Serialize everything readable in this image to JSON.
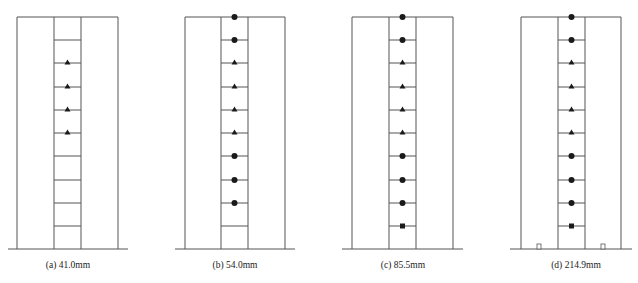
{
  "colors": {
    "line": "#555555",
    "marker": "#1a1a1a",
    "background": "#ffffff"
  },
  "layout": {
    "top_y": 17,
    "ground_y": 249,
    "rung_y": [
      40,
      63,
      87,
      110,
      133,
      156,
      180,
      203,
      226
    ]
  },
  "panels": [
    {
      "id": "a",
      "caption": "(a) 41.0mm",
      "outer": [
        17,
        118
      ],
      "inner": [
        54,
        81
      ],
      "ground": [
        8,
        128
      ],
      "markers": [
        {
          "level": 2,
          "shape": "triangle"
        },
        {
          "level": 3,
          "shape": "triangle"
        },
        {
          "level": 4,
          "shape": "triangle"
        },
        {
          "level": 5,
          "shape": "triangle"
        }
      ],
      "base_squares": []
    },
    {
      "id": "b",
      "caption": "(b) 54.0mm",
      "outer": [
        185,
        285
      ],
      "inner": [
        221,
        248
      ],
      "ground": [
        175,
        295
      ],
      "markers": [
        {
          "level": 0,
          "shape": "circle"
        },
        {
          "level": 1,
          "shape": "circle"
        },
        {
          "level": 2,
          "shape": "triangle"
        },
        {
          "level": 3,
          "shape": "triangle"
        },
        {
          "level": 4,
          "shape": "triangle"
        },
        {
          "level": 5,
          "shape": "triangle"
        },
        {
          "level": 6,
          "shape": "circle"
        },
        {
          "level": 7,
          "shape": "circle"
        },
        {
          "level": 8,
          "shape": "circle"
        }
      ],
      "base_squares": []
    },
    {
      "id": "c",
      "caption": "(c) 85.5mm",
      "outer": [
        352,
        453
      ],
      "inner": [
        389,
        416
      ],
      "ground": [
        342,
        463
      ],
      "markers": [
        {
          "level": 0,
          "shape": "circle"
        },
        {
          "level": 1,
          "shape": "circle"
        },
        {
          "level": 2,
          "shape": "triangle"
        },
        {
          "level": 3,
          "shape": "triangle"
        },
        {
          "level": 4,
          "shape": "triangle"
        },
        {
          "level": 5,
          "shape": "triangle"
        },
        {
          "level": 6,
          "shape": "circle"
        },
        {
          "level": 7,
          "shape": "circle"
        },
        {
          "level": 8,
          "shape": "circle"
        },
        {
          "level": 9,
          "shape": "square"
        }
      ],
      "base_squares": []
    },
    {
      "id": "d",
      "caption": "(d) 214.9mm",
      "outer": [
        521,
        621
      ],
      "inner": [
        558,
        585
      ],
      "ground": [
        510,
        632
      ],
      "markers": [
        {
          "level": 0,
          "shape": "circle"
        },
        {
          "level": 1,
          "shape": "circle"
        },
        {
          "level": 2,
          "shape": "triangle"
        },
        {
          "level": 3,
          "shape": "triangle"
        },
        {
          "level": 4,
          "shape": "triangle"
        },
        {
          "level": 5,
          "shape": "triangle"
        },
        {
          "level": 6,
          "shape": "circle"
        },
        {
          "level": 7,
          "shape": "circle"
        },
        {
          "level": 8,
          "shape": "circle"
        },
        {
          "level": 9,
          "shape": "square"
        }
      ],
      "base_squares": [
        539,
        603
      ]
    }
  ]
}
